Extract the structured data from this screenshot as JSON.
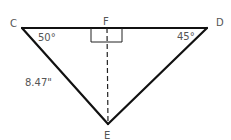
{
  "diagram": {
    "type": "triangle",
    "vertices": {
      "C": {
        "label": "C"
      },
      "D": {
        "label": "D"
      },
      "E": {
        "label": "E"
      },
      "F": {
        "label": "F"
      }
    },
    "angles": {
      "C": "50°",
      "D": "45°",
      "F": "right-angle"
    },
    "measurements": {
      "CE": "8.47\""
    },
    "segments": [
      "CD",
      "CE",
      "DE",
      "FE (dashed altitude)"
    ]
  }
}
